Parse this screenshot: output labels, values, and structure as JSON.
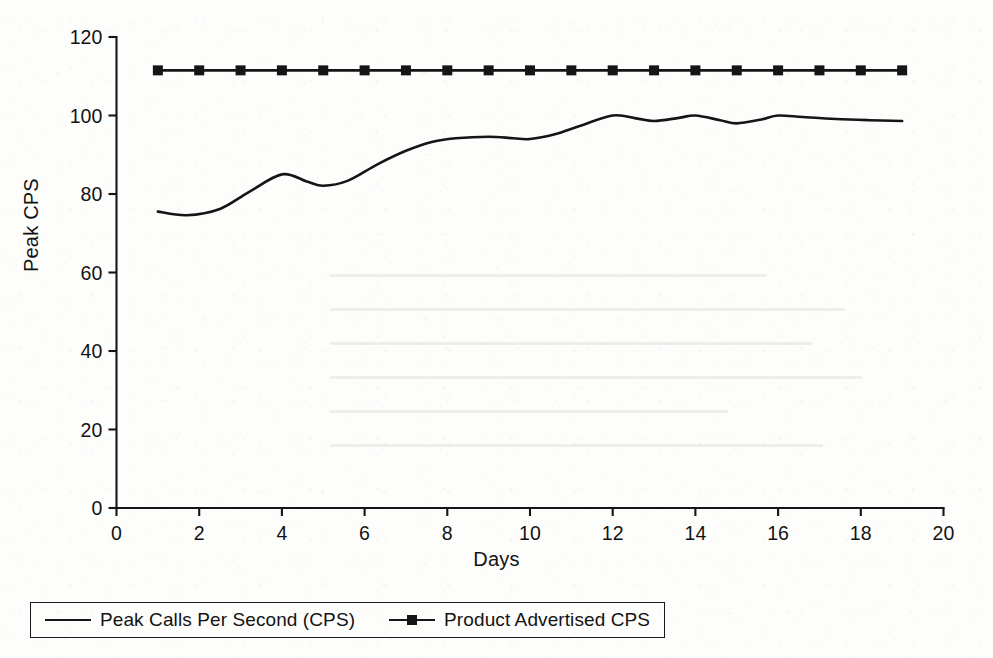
{
  "chart_data": {
    "type": "line",
    "title": "",
    "xlabel": "Days",
    "ylabel": "Peak CPS",
    "xlim": [
      0,
      20
    ],
    "ylim": [
      0,
      120
    ],
    "xticks": [
      0,
      2,
      4,
      6,
      8,
      10,
      12,
      14,
      16,
      18,
      20
    ],
    "yticks": [
      0,
      20,
      40,
      60,
      80,
      100,
      120
    ],
    "grid": false,
    "legend_position": "bottom-left",
    "series": [
      {
        "name": "Peak Calls Per Second (CPS)",
        "marker": "none",
        "color": "#151515",
        "x": [
          1,
          1.7,
          2.5,
          3.2,
          4,
          4.6,
          5,
          5.6,
          6.3,
          7,
          7.6,
          8.2,
          9,
          9.6,
          10,
          10.6,
          11.2,
          12,
          12.6,
          13,
          13.6,
          14,
          14.6,
          15,
          15.6,
          16,
          16.6,
          17.4,
          18.2,
          19
        ],
        "values": [
          75.5,
          74.6,
          76.2,
          80.5,
          85.0,
          83.2,
          82.1,
          83.4,
          87.5,
          91.0,
          93.2,
          94.2,
          94.6,
          94.2,
          94.0,
          95.2,
          97.3,
          100.0,
          99.2,
          98.6,
          99.4,
          100.0,
          98.8,
          98.0,
          99.0,
          100.0,
          99.6,
          99.1,
          98.8,
          98.6
        ]
      },
      {
        "name": "Product Advertised CPS",
        "marker": "square",
        "color": "#151515",
        "x": [
          1,
          2,
          3,
          4,
          5,
          6,
          7,
          8,
          9,
          10,
          11,
          12,
          13,
          14,
          15,
          16,
          17,
          18,
          19
        ],
        "values": [
          111.5,
          111.5,
          111.5,
          111.5,
          111.5,
          111.5,
          111.5,
          111.5,
          111.5,
          111.5,
          111.5,
          111.5,
          111.5,
          111.5,
          111.5,
          111.5,
          111.5,
          111.5,
          111.5
        ]
      }
    ]
  },
  "axes": {
    "y_title": "Peak CPS",
    "x_title": "Days",
    "y_tick_labels": [
      "0",
      "20",
      "40",
      "60",
      "80",
      "100",
      "120"
    ],
    "x_tick_labels": [
      "0",
      "2",
      "4",
      "6",
      "8",
      "10",
      "12",
      "14",
      "16",
      "18",
      "20"
    ]
  },
  "legend": {
    "items": [
      {
        "label": "Peak Calls Per Second (CPS)",
        "marker": "line"
      },
      {
        "label": "Product Advertised CPS",
        "marker": "line-square"
      }
    ]
  },
  "colors": {
    "ink": "#151515",
    "paper": "#fdfdfc"
  }
}
